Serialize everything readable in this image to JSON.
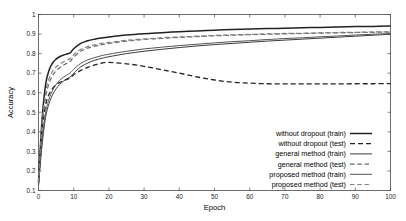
{
  "chart_data": {
    "type": "line",
    "title": "",
    "xlabel": "Epoch",
    "ylabel": "Accuracy",
    "xlim": [
      0,
      100
    ],
    "ylim": [
      0.1,
      1.0
    ],
    "xticks": [
      0,
      10,
      20,
      30,
      40,
      50,
      60,
      70,
      80,
      90,
      100
    ],
    "xtick_labels": [
      "0",
      "10",
      "20",
      "30",
      "40",
      "50",
      "60",
      "70",
      "80",
      "90",
      "100"
    ],
    "yticks": [
      0.1,
      0.2,
      0.3,
      0.4,
      0.5,
      0.6,
      0.7,
      0.8,
      0.9,
      1.0
    ],
    "ytick_labels": [
      "0.1",
      "0.2",
      "0.3",
      "0.4",
      "0.5",
      "0.6",
      "0.7",
      "0.8",
      "0.9",
      "1"
    ],
    "grid": false,
    "legend_position": "lower right",
    "x": [
      0,
      1,
      2,
      3,
      4,
      5,
      6,
      7,
      8,
      9,
      10,
      12,
      14,
      16,
      18,
      20,
      25,
      30,
      35,
      40,
      45,
      50,
      55,
      60,
      65,
      70,
      75,
      80,
      85,
      90,
      95,
      100
    ],
    "series": [
      {
        "name": "without dropout (train)",
        "style": "solid",
        "color": "#222222",
        "width": 1.5,
        "values": [
          0.145,
          0.46,
          0.64,
          0.715,
          0.752,
          0.772,
          0.784,
          0.792,
          0.798,
          0.804,
          0.825,
          0.852,
          0.866,
          0.874,
          0.88,
          0.885,
          0.895,
          0.902,
          0.907,
          0.912,
          0.916,
          0.92,
          0.923,
          0.926,
          0.928,
          0.93,
          0.932,
          0.934,
          0.936,
          0.938,
          0.939,
          0.941
        ]
      },
      {
        "name": "without dropout (test)",
        "style": "dashed",
        "color": "#222222",
        "width": 1.3,
        "values": [
          0.135,
          0.4,
          0.535,
          0.592,
          0.622,
          0.64,
          0.652,
          0.661,
          0.668,
          0.675,
          0.692,
          0.714,
          0.73,
          0.742,
          0.752,
          0.755,
          0.748,
          0.735,
          0.718,
          0.7,
          0.681,
          0.665,
          0.654,
          0.649,
          0.646,
          0.645,
          0.645,
          0.645,
          0.645,
          0.646,
          0.646,
          0.647
        ]
      },
      {
        "name": "general method (train)",
        "style": "solid",
        "color": "#3a3a3a",
        "width": 1.0,
        "values": [
          0.128,
          0.33,
          0.472,
          0.545,
          0.59,
          0.62,
          0.642,
          0.658,
          0.67,
          0.681,
          0.7,
          0.732,
          0.752,
          0.766,
          0.776,
          0.784,
          0.8,
          0.812,
          0.822,
          0.831,
          0.839,
          0.846,
          0.852,
          0.858,
          0.864,
          0.869,
          0.874,
          0.879,
          0.884,
          0.889,
          0.894,
          0.899
        ]
      },
      {
        "name": "general method (test)",
        "style": "dashed",
        "color": "#6a6a6a",
        "width": 1.2,
        "values": [
          0.138,
          0.42,
          0.575,
          0.648,
          0.688,
          0.712,
          0.728,
          0.74,
          0.75,
          0.76,
          0.782,
          0.812,
          0.828,
          0.838,
          0.846,
          0.852,
          0.864,
          0.872,
          0.878,
          0.883,
          0.887,
          0.891,
          0.894,
          0.897,
          0.899,
          0.901,
          0.903,
          0.905,
          0.906,
          0.908,
          0.909,
          0.91
        ]
      },
      {
        "name": "proposed method (train)",
        "style": "solid",
        "color": "#555555",
        "width": 1.0,
        "values": [
          0.132,
          0.35,
          0.495,
          0.568,
          0.612,
          0.642,
          0.663,
          0.678,
          0.69,
          0.701,
          0.72,
          0.75,
          0.768,
          0.78,
          0.79,
          0.797,
          0.812,
          0.824,
          0.833,
          0.841,
          0.848,
          0.855,
          0.861,
          0.866,
          0.872,
          0.877,
          0.881,
          0.886,
          0.89,
          0.895,
          0.899,
          0.903
        ]
      },
      {
        "name": "proposed method (test)",
        "style": "dashed",
        "color": "#808080",
        "width": 1.2,
        "values": [
          0.142,
          0.44,
          0.6,
          0.672,
          0.71,
          0.732,
          0.746,
          0.757,
          0.766,
          0.775,
          0.795,
          0.822,
          0.836,
          0.845,
          0.852,
          0.857,
          0.868,
          0.875,
          0.881,
          0.885,
          0.889,
          0.893,
          0.896,
          0.898,
          0.901,
          0.903,
          0.904,
          0.906,
          0.908,
          0.909,
          0.911,
          0.912
        ]
      }
    ]
  },
  "legend": {
    "entries": [
      {
        "label": "without dropout (train)",
        "style": "solid"
      },
      {
        "label": "without dropout (test)",
        "style": "dashed"
      },
      {
        "label": "general method (train)",
        "style": "solid"
      },
      {
        "label": "general method (test)",
        "style": "dashed"
      },
      {
        "label": "proposed method (train)",
        "style": "solid"
      },
      {
        "label": "proposed method (test)",
        "style": "dashed"
      }
    ]
  }
}
